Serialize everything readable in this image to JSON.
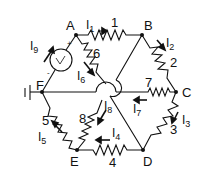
{
  "diagram": {
    "type": "resistor-network",
    "nodes": {
      "A": {
        "label": "A",
        "x": 76,
        "y": 35
      },
      "B": {
        "label": "B",
        "x": 142,
        "y": 35
      },
      "C": {
        "label": "C",
        "x": 176,
        "y": 92
      },
      "D": {
        "label": "D",
        "x": 143,
        "y": 150
      },
      "E": {
        "label": "E",
        "x": 77,
        "y": 150
      },
      "F": {
        "label": "F",
        "x": 42,
        "y": 92
      }
    },
    "resistors": [
      {
        "id": "1",
        "label": "1",
        "from": "A",
        "to": "B"
      },
      {
        "id": "2",
        "label": "2",
        "from": "B",
        "to": "C"
      },
      {
        "id": "3",
        "label": "3",
        "from": "C",
        "to": "D"
      },
      {
        "id": "4",
        "label": "4",
        "from": "D",
        "to": "E"
      },
      {
        "id": "5",
        "label": "5",
        "from": "E",
        "to": "F"
      },
      {
        "id": "6",
        "label": "6",
        "from": "A",
        "to": "center"
      },
      {
        "id": "7",
        "label": "7",
        "from": "C",
        "to": "F"
      },
      {
        "id": "8",
        "label": "8",
        "from": "E",
        "to": "center"
      }
    ],
    "source": {
      "label": "V",
      "between": [
        "F",
        "A"
      ],
      "plus_marker": "+",
      "minus_marker": "-"
    },
    "ground": {
      "at": "F"
    },
    "currents": {
      "I1": {
        "base": "I",
        "sub": "1"
      },
      "I2": {
        "base": "I",
        "sub": "2"
      },
      "I3": {
        "base": "I",
        "sub": "3"
      },
      "I4": {
        "base": "I",
        "sub": "4"
      },
      "I5": {
        "base": "I",
        "sub": "5"
      },
      "I6": {
        "base": "I",
        "sub": "6"
      },
      "I7": {
        "base": "I",
        "sub": "7"
      },
      "I8": {
        "base": "I",
        "sub": "8"
      },
      "I9": {
        "base": "I",
        "sub": "9"
      }
    },
    "colors": {
      "wire": "#111111",
      "background": "#ffffff"
    }
  }
}
